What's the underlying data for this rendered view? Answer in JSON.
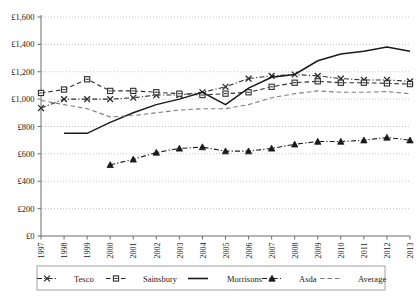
{
  "chart_data": {
    "type": "line",
    "title": "",
    "xlabel": "",
    "ylabel": "",
    "grid": true,
    "legend_position": "bottom",
    "ylim": [
      0,
      1600
    ],
    "yticks": [
      0,
      200,
      400,
      600,
      800,
      1000,
      1200,
      1400,
      1600
    ],
    "ytick_labels": [
      "£0",
      "£200",
      "£400",
      "£600",
      "£800",
      "£1,000",
      "£1,200",
      "£1,400",
      "£1,600"
    ],
    "categories": [
      "1997",
      "1998",
      "1999",
      "2000",
      "2001",
      "2002",
      "2003",
      "2004",
      "2005",
      "2006",
      "2007",
      "2008",
      "2009",
      "2010",
      "2011",
      "2012",
      "2013"
    ],
    "series": [
      {
        "name": "Tesco",
        "marker": "x",
        "dash": "dash-dot",
        "color": "#2e2e2e",
        "x": [
          "1997",
          "1998",
          "1999",
          "2000",
          "2001",
          "2002",
          "2003",
          "2004",
          "2005",
          "2006",
          "2007",
          "2008",
          "2009",
          "2010",
          "2011",
          "2012",
          "2013"
        ],
        "values": [
          935,
          1000,
          1000,
          1000,
          1010,
          1030,
          1030,
          1050,
          1090,
          1150,
          1170,
          1180,
          1170,
          1150,
          1140,
          1140,
          1130
        ]
      },
      {
        "name": "Sainsbury",
        "marker": "square",
        "dash": "dashed",
        "color": "#2e2e2e",
        "x": [
          "1997",
          "1998",
          "1999",
          "2000",
          "2001",
          "2002",
          "2003",
          "2004",
          "2005",
          "2006",
          "2007",
          "2008",
          "2009",
          "2010",
          "2011",
          "2012",
          "2013"
        ],
        "values": [
          1045,
          1070,
          1145,
          1060,
          1060,
          1050,
          1040,
          1030,
          1040,
          1050,
          1090,
          1120,
          1130,
          1120,
          1120,
          1115,
          1110
        ]
      },
      {
        "name": "Morrisons",
        "marker": "none",
        "dash": "solid",
        "color": "#1a1a1a",
        "x": [
          "1998",
          "1999",
          "2000",
          "2001",
          "2002",
          "2003",
          "2004",
          "2005",
          "2006",
          "2007",
          "2008",
          "2009",
          "2010",
          "2011",
          "2012",
          "2013"
        ],
        "values": [
          750,
          750,
          830,
          900,
          960,
          1000,
          1050,
          960,
          1080,
          1160,
          1180,
          1280,
          1330,
          1350,
          1380,
          1350
        ]
      },
      {
        "name": "Asda",
        "marker": "triangle",
        "dash": "dash-dot",
        "color": "#1a1a1a",
        "x": [
          "2000",
          "2001",
          "2002",
          "2003",
          "2004",
          "2005",
          "2006",
          "2007",
          "2008",
          "2009",
          "2010",
          "2011",
          "2012",
          "2013"
        ],
        "values": [
          520,
          560,
          610,
          640,
          650,
          620,
          620,
          640,
          670,
          690,
          690,
          700,
          720,
          700
        ]
      },
      {
        "name": "Average",
        "marker": "none",
        "dash": "dashed",
        "color": "#7d7d7d",
        "x": [
          "1997",
          "1998",
          "1999",
          "2000",
          "2001",
          "2002",
          "2003",
          "2004",
          "2005",
          "2006",
          "2007",
          "2008",
          "2009",
          "2010",
          "2011",
          "2012",
          "2013"
        ],
        "values": [
          990,
          960,
          930,
          870,
          880,
          900,
          920,
          930,
          930,
          960,
          1010,
          1040,
          1060,
          1050,
          1050,
          1055,
          1040
        ]
      }
    ]
  },
  "legend": {
    "items": [
      {
        "label": "Tesco"
      },
      {
        "label": "Sainsbury"
      },
      {
        "label": "Morrisons"
      },
      {
        "label": "Asda"
      },
      {
        "label": "Average"
      }
    ]
  },
  "colors": {
    "axis": "#6d6d6d",
    "grid": "#b9b9b9",
    "dark": "#1a1a1a",
    "average": "#7d7d7d"
  }
}
